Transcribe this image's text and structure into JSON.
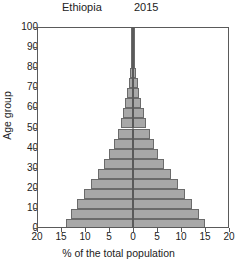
{
  "header": {
    "title": "Ethiopia",
    "year": "2015"
  },
  "legend": {
    "left_label": "Males",
    "right_label": "Females"
  },
  "axes": {
    "ylabel": "Age group",
    "xlabel": "% of the total population",
    "yticks": [
      "0",
      "10",
      "20",
      "30",
      "40",
      "50",
      "60",
      "70",
      "80",
      "90",
      "100"
    ],
    "xticks": [
      "20",
      "15",
      "10",
      "5",
      "0",
      "5",
      "10",
      "15",
      "20"
    ]
  },
  "style": {
    "bar_fill": "#a8a8a8",
    "bar_stroke": "#6b6b6b",
    "axis_color": "#5a5a5a",
    "text_color": "#222222",
    "background": "#ffffff"
  },
  "chart_data": {
    "type": "bar",
    "subtype": "population-pyramid",
    "title": "Ethiopia",
    "subtitle": "2015",
    "xlabel": "% of the total population",
    "ylabel": "Age group",
    "xlim": [
      -20,
      20
    ],
    "ylim": [
      0,
      100
    ],
    "xticks": [
      20,
      15,
      10,
      5,
      0,
      5,
      10,
      15,
      20
    ],
    "yticks": [
      0,
      10,
      20,
      30,
      40,
      50,
      60,
      70,
      80,
      90,
      100
    ],
    "grid": false,
    "legend_position": "inside-top-corners",
    "orientation": "horizontal",
    "age_band_width": 5,
    "categories": [
      "0-4",
      "5-9",
      "10-14",
      "15-19",
      "20-24",
      "25-29",
      "30-34",
      "35-39",
      "40-44",
      "45-49",
      "50-54",
      "55-59",
      "60-64",
      "65-69",
      "70-74",
      "75-79",
      "80-84",
      "85-89",
      "90-94",
      "95-99",
      "100+"
    ],
    "series": [
      {
        "name": "Males",
        "side": "left",
        "values": [
          14.0,
          13.0,
          11.7,
          10.2,
          8.7,
          7.3,
          6.0,
          4.9,
          4.0,
          3.2,
          2.6,
          2.0,
          1.6,
          1.2,
          0.85,
          0.55,
          0.32,
          0.16,
          0.07,
          0.02,
          0.01
        ]
      },
      {
        "name": "Females",
        "side": "right",
        "values": [
          15.0,
          13.7,
          12.3,
          10.8,
          9.3,
          7.9,
          6.5,
          5.3,
          4.3,
          3.5,
          2.8,
          2.2,
          1.75,
          1.3,
          0.95,
          0.62,
          0.36,
          0.18,
          0.08,
          0.02,
          0.01
        ]
      }
    ]
  }
}
